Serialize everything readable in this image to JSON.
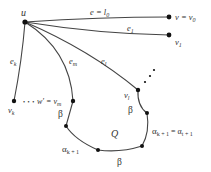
{
  "diagram": {
    "type": "graph",
    "colors": {
      "stroke": "#444444",
      "node": "#111111",
      "text": "#333333",
      "background": "#ffffff"
    },
    "nodes": {
      "u": {
        "label": "u"
      },
      "v0": {
        "label_main": "v = v",
        "label_sub": "0"
      },
      "v1": {
        "label_main": "v",
        "label_sub": "1"
      },
      "vk": {
        "label_main": "v",
        "label_sub": "k"
      },
      "vm": {
        "label_main": "w' = v",
        "label_sub": "m"
      },
      "vl": {
        "label_main": "v",
        "label_sub": "l"
      }
    },
    "edges": {
      "e_l0": {
        "label_main": "e = l",
        "label_sub": "0"
      },
      "e1": {
        "label_main": "e",
        "label_sub": "1"
      },
      "ek": {
        "label_main": "e",
        "label_sub": "k"
      },
      "em": {
        "label_main": "e",
        "label_sub": "m"
      },
      "el": {
        "label_main": "e",
        "label_sub": "l"
      }
    },
    "ellipsis_horizontal": "• • •",
    "region_label": "Q",
    "path_labels": {
      "beta_left": "β",
      "beta_right": "β",
      "beta_bottom": "β",
      "alpha_left_main": "α",
      "alpha_left_sub": "k + 1",
      "alpha_right_main": "α",
      "alpha_right_sub": "k + 1",
      "alpha_right_eq": " = α",
      "alpha_right_sub2": "t + 1"
    }
  }
}
